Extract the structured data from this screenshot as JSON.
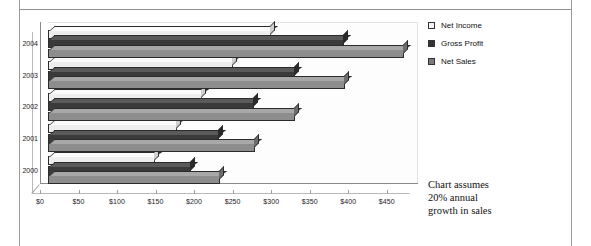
{
  "frame": {
    "has_top_rule": true,
    "has_side_rules": true,
    "border_color": "#9a9a9a"
  },
  "legend": {
    "position": "right",
    "items": [
      {
        "label": "Net Income",
        "color": "#f4f4f4",
        "marker": "square-outline"
      },
      {
        "label": "Gross Profit",
        "color": "#333333",
        "marker": "square-filled"
      },
      {
        "label": "Net Sales",
        "color": "#7b7b7b",
        "marker": "square-filled"
      }
    ]
  },
  "note": {
    "line1": "Chart assumes",
    "line2": "20% annual",
    "line3": "growth in sales",
    "full_text": "Chart assumes 20% annual growth in sales"
  },
  "chart_data": {
    "type": "bar",
    "orientation": "horizontal",
    "style": "3d-clustered-bar",
    "title": "",
    "subtitle": "",
    "xlabel": "",
    "ylabel": "",
    "categories": [
      "2000",
      "2001",
      "2002",
      "2003",
      "2004"
    ],
    "category_order_top_to_bottom": [
      "2004",
      "2003",
      "2002",
      "2001",
      "2000"
    ],
    "series": [
      {
        "name": "Net Income",
        "color": "#eeeeee",
        "values": [
          139,
          167,
          200,
          240,
          289
        ]
      },
      {
        "name": "Gross Profit",
        "color": "#3a3a3a",
        "values": [
          185,
          222,
          267,
          320,
          384
        ]
      },
      {
        "name": "Net Sales",
        "color": "#8d8d8d",
        "values": [
          223,
          268,
          321,
          385,
          462
        ]
      }
    ],
    "xlim": [
      0,
      475
    ],
    "xticks": [
      0,
      50,
      100,
      150,
      200,
      250,
      300,
      350,
      400,
      450
    ],
    "xticklabels": [
      "$0",
      "$50",
      "$100",
      "$150",
      "$200",
      "$250",
      "$300",
      "$350",
      "$400",
      "$450"
    ],
    "grid": false,
    "legend_position": "right",
    "annotations": [
      "Chart assumes 20% annual growth in sales"
    ]
  }
}
